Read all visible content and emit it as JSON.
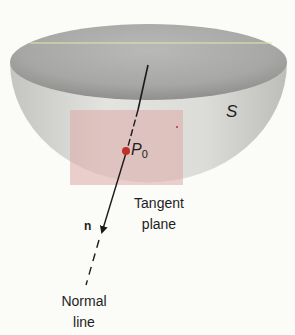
{
  "figure": {
    "surface_label": "S",
    "point_label": "P",
    "point_subscript": "0",
    "tangent_plane_label_line1": "Tangent",
    "tangent_plane_label_line2": "plane",
    "normal_vector_label": "n",
    "normal_line_label_line1": "Normal",
    "normal_line_label_line2": "line"
  },
  "colors": {
    "background": "#fbfbf8",
    "bowl_outer": "#d9d9d6",
    "bowl_inner": "#a9a9a7",
    "tangent_plane": "#e8c6c4",
    "point": "#c0302a",
    "line": "#1a1a1a",
    "rim_highlight": "#e8e8a8"
  }
}
